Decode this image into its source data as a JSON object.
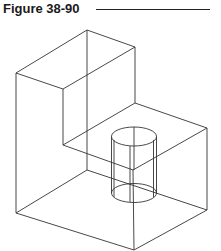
{
  "figure": {
    "label": "Figure 38-90"
  },
  "colors": {
    "line": "#333333",
    "text": "#1a1a1a",
    "background": "#ffffff"
  }
}
